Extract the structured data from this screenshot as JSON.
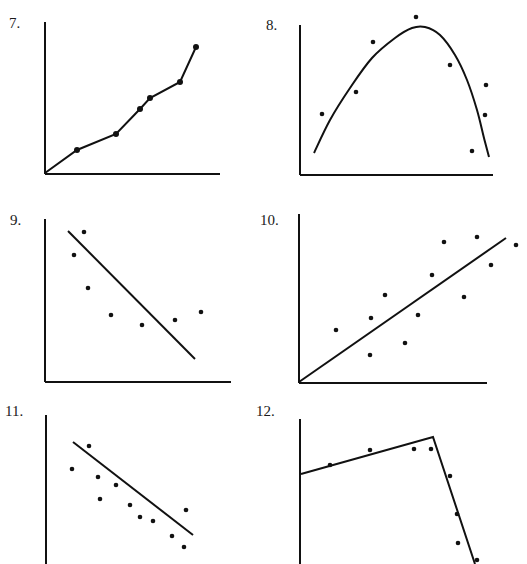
{
  "page": {
    "labels": [
      "7.",
      "8.",
      "9.",
      "10.",
      "11.",
      "12."
    ]
  },
  "colors": {
    "ink": "#111111",
    "background": "#ffffff"
  },
  "chart_data": [
    {
      "id": "7",
      "label": "7.",
      "type": "line",
      "title": "",
      "xlabel": "",
      "ylabel": "",
      "grid": false,
      "legend": null,
      "axes_px": {
        "origin": [
          45,
          174
        ],
        "x_end": 220,
        "y_top": 22
      },
      "series": [
        {
          "name": "data",
          "markers": true,
          "points_px": [
            [
              45,
              173
            ],
            [
              77,
              150
            ],
            [
              116,
              134
            ],
            [
              140,
              109
            ],
            [
              150,
              98
            ],
            [
              180,
              82
            ],
            [
              196,
              47
            ]
          ]
        }
      ]
    },
    {
      "id": "8",
      "label": "8.",
      "type": "scatter",
      "title": "",
      "xlabel": "",
      "ylabel": "",
      "grid": false,
      "legend": null,
      "axes_px": {
        "origin": [
          300,
          175
        ],
        "x_end": 493,
        "y_top": 25
      },
      "fit": {
        "kind": "curve (inverted parabola, skewed)",
        "path_px": [
          [
            314,
            153
          ],
          [
            330,
            120
          ],
          [
            350,
            88
          ],
          [
            372,
            58
          ],
          [
            395,
            38
          ],
          [
            412,
            28
          ],
          [
            425,
            27
          ],
          [
            440,
            35
          ],
          [
            455,
            55
          ],
          [
            467,
            80
          ],
          [
            477,
            110
          ],
          [
            484,
            138
          ],
          [
            489,
            157
          ]
        ]
      },
      "points_px": [
        [
          322,
          114
        ],
        [
          356,
          92
        ],
        [
          373,
          42
        ],
        [
          416,
          17
        ],
        [
          450,
          65
        ],
        [
          486,
          85
        ],
        [
          485,
          115
        ],
        [
          472,
          151
        ]
      ]
    },
    {
      "id": "9",
      "label": "9.",
      "type": "scatter",
      "title": "",
      "xlabel": "",
      "ylabel": "",
      "grid": false,
      "legend": null,
      "axes_px": {
        "origin": [
          45,
          382
        ],
        "x_end": 231,
        "y_top": 219
      },
      "fit": {
        "kind": "straight line",
        "path_px": [
          [
            68,
            231
          ],
          [
            195,
            359
          ]
        ]
      },
      "points_px": [
        [
          84,
          232
        ],
        [
          74,
          255
        ],
        [
          88,
          288
        ],
        [
          111,
          315
        ],
        [
          142,
          325
        ],
        [
          175,
          320
        ],
        [
          201,
          312
        ]
      ]
    },
    {
      "id": "10",
      "label": "10.",
      "type": "scatter",
      "title": "",
      "xlabel": "",
      "ylabel": "",
      "grid": false,
      "legend": null,
      "axes_px": {
        "origin": [
          299,
          383
        ],
        "x_end": 487,
        "y_top": 214
      },
      "fit": {
        "kind": "straight line",
        "path_px": [
          [
            299,
            382
          ],
          [
            506,
            238
          ]
        ]
      },
      "points_px": [
        [
          336,
          330
        ],
        [
          370,
          355
        ],
        [
          371,
          318
        ],
        [
          385,
          295
        ],
        [
          405,
          343
        ],
        [
          418,
          315
        ],
        [
          432,
          275
        ],
        [
          444,
          242
        ],
        [
          477,
          237
        ],
        [
          491,
          265
        ],
        [
          464,
          297
        ],
        [
          516,
          245
        ]
      ]
    },
    {
      "id": "11",
      "label": "11.",
      "type": "scatter",
      "title": "",
      "xlabel": "",
      "ylabel": "",
      "grid": false,
      "legend": null,
      "axes_px": {
        "origin": [
          46,
          564
        ],
        "x_end": null,
        "y_top": 415
      },
      "fit": {
        "kind": "straight line",
        "path_px": [
          [
            73,
            442
          ],
          [
            193,
            535
          ]
        ]
      },
      "points_px": [
        [
          89,
          446
        ],
        [
          72,
          469
        ],
        [
          98,
          477
        ],
        [
          116,
          485
        ],
        [
          100,
          499
        ],
        [
          130,
          505
        ],
        [
          140,
          517
        ],
        [
          153,
          521
        ],
        [
          186,
          510
        ],
        [
          172,
          536
        ],
        [
          184,
          547
        ]
      ]
    },
    {
      "id": "12",
      "label": "12.",
      "type": "scatter",
      "title": "",
      "xlabel": "",
      "ylabel": "",
      "grid": false,
      "legend": null,
      "axes_px": {
        "origin": [
          300,
          564
        ],
        "x_end": null,
        "y_top": 419
      },
      "fit": {
        "kind": "piecewise linear (two segments)",
        "path_px": [
          [
            301,
            474
          ],
          [
            433,
            437
          ],
          [
            475,
            564
          ]
        ]
      },
      "points_px": [
        [
          330,
          465
        ],
        [
          370,
          450
        ],
        [
          414,
          449
        ],
        [
          431,
          449
        ],
        [
          450,
          476
        ],
        [
          457,
          514
        ],
        [
          458,
          543
        ],
        [
          477,
          560
        ]
      ]
    }
  ]
}
